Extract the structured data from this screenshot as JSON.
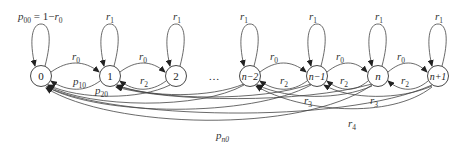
{
  "diagram": {
    "type": "markov-chain-state-diagram",
    "nodes": [
      {
        "id": "0",
        "label": "0",
        "x": 41
      },
      {
        "id": "1",
        "label": "1",
        "x": 110
      },
      {
        "id": "2",
        "label": "2",
        "x": 176
      },
      {
        "id": "n-2",
        "label": "n−2",
        "x": 250
      },
      {
        "id": "n-1",
        "label": "n−1",
        "x": 317
      },
      {
        "id": "n",
        "label": "n",
        "x": 378
      },
      {
        "id": "n+1",
        "label": "n+1",
        "x": 438
      }
    ],
    "ellipsis": "…",
    "self_loops": [
      {
        "node": "0",
        "label_main": "p",
        "label_sub": "00",
        "label_rest": " = 1−",
        "label_var": "r",
        "label_var_sub": "0"
      },
      {
        "node": "1",
        "label_main": "r",
        "label_sub": "1"
      },
      {
        "node": "2",
        "label_main": "r",
        "label_sub": "1"
      },
      {
        "node": "n-2",
        "label_main": "r",
        "label_sub": "1"
      },
      {
        "node": "n-1",
        "label_main": "r",
        "label_sub": "1"
      },
      {
        "node": "n",
        "label_main": "r",
        "label_sub": "1"
      },
      {
        "node": "n+1",
        "label_main": "r",
        "label_sub": "1"
      }
    ],
    "edges": [
      {
        "from": "0",
        "to": "1",
        "label_main": "r",
        "label_sub": "0"
      },
      {
        "from": "1",
        "to": "2",
        "label_main": "r",
        "label_sub": "0"
      },
      {
        "from": "n-2",
        "to": "n-1",
        "label_main": "r",
        "label_sub": "0"
      },
      {
        "from": "n-1",
        "to": "n",
        "label_main": "r",
        "label_sub": "0"
      },
      {
        "from": "n",
        "to": "n+1",
        "label_main": "r",
        "label_sub": "0"
      },
      {
        "from": "1",
        "to": "0",
        "label_main": "p",
        "label_sub": "10"
      },
      {
        "from": "2",
        "to": "1",
        "label_main": "r",
        "label_sub": "2"
      },
      {
        "from": "n-1",
        "to": "n-2",
        "label_main": "r",
        "label_sub": "2"
      },
      {
        "from": "n",
        "to": "n-1",
        "label_main": "r",
        "label_sub": "2"
      },
      {
        "from": "n+1",
        "to": "n",
        "label_main": "r",
        "label_sub": "2"
      },
      {
        "from": "2",
        "to": "0",
        "label_main": "p",
        "label_sub": "20"
      },
      {
        "from": "n",
        "to": "n-2",
        "label_main": "r",
        "label_sub": "3"
      },
      {
        "from": "n+1",
        "to": "n-1",
        "label_main": "r",
        "label_sub": "3"
      },
      {
        "from": "n+1",
        "to": "n-2",
        "label_main": "r",
        "label_sub": "4"
      },
      {
        "from": "n",
        "to": "0",
        "label_main": "p",
        "label_sub": "n0"
      }
    ]
  }
}
